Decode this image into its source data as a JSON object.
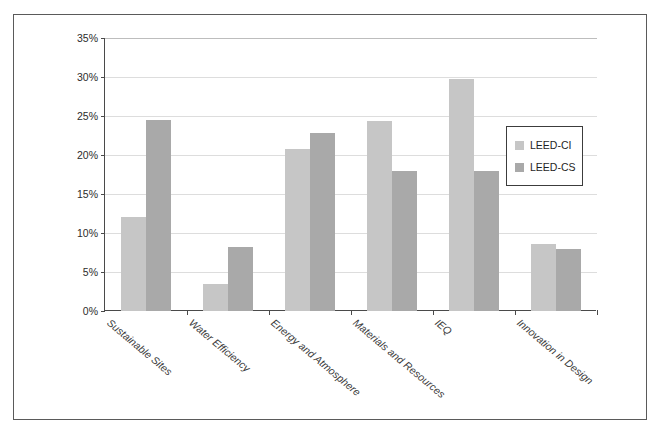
{
  "chart_data": {
    "type": "bar",
    "title": "",
    "subtitle": "",
    "xlabel": "",
    "ylabel": "",
    "ylim": [
      0,
      35
    ],
    "ytick_values": [
      0,
      5,
      10,
      15,
      20,
      25,
      30,
      35
    ],
    "ytick_labels": [
      "0%",
      "5%",
      "10%",
      "15%",
      "20%",
      "25%",
      "30%",
      "35%"
    ],
    "grid": true,
    "legend_position": "center-right",
    "categories": [
      "Sustainable Sites",
      "Water Efficiency",
      "Energy and Atmosphere",
      "Materials and Resources",
      "IEQ",
      "Innovation in Design"
    ],
    "series": [
      {
        "name": "LEED-CI",
        "color": "#c6c6c6",
        "values": [
          12.1,
          3.5,
          20.8,
          24.3,
          29.7,
          8.6
        ]
      },
      {
        "name": "LEED-CS",
        "color": "#a9a9a9",
        "values": [
          24.5,
          8.2,
          22.8,
          17.9,
          17.9,
          8.0
        ]
      }
    ]
  },
  "legend": {
    "entries": [
      {
        "label": "LEED-CI"
      },
      {
        "label": "LEED-CS"
      }
    ]
  },
  "colors": {
    "series_ci": "#c6c6c6",
    "series_cs": "#a9a9a9",
    "axis": "#4a4a4a",
    "grid": "#dddddd",
    "frame": "#5a5a5a"
  }
}
